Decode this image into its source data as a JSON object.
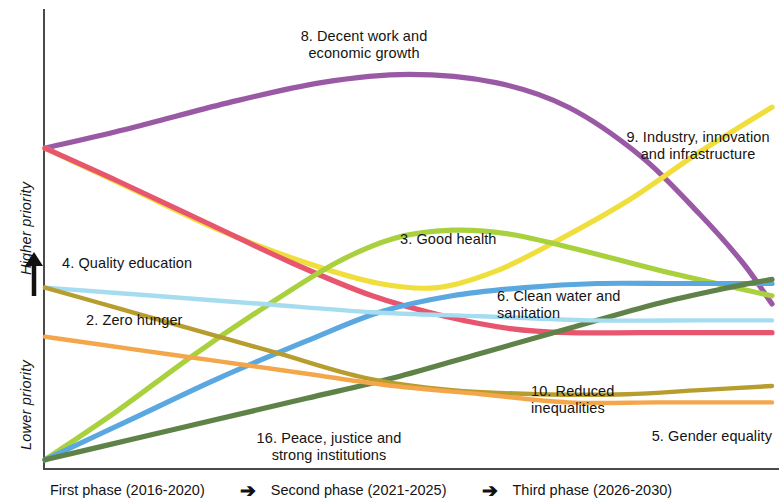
{
  "chart_data": {
    "type": "line",
    "title": "",
    "subtitle": "",
    "xlabel": "",
    "ylabel": "priority",
    "grid": false,
    "legend_position": "inline-annotations",
    "x": [
      "First phase (2016-2020)",
      "Second phase (2021-2025)",
      "Third phase (2026-2030)"
    ],
    "xlim": [
      0,
      100
    ],
    "ylim": [
      0,
      100
    ],
    "y_axis_ticks": [
      "Lower priority",
      "Higher priority"
    ],
    "y_axis_direction": "up",
    "note": "Relative priority of SDGs over three phases; y values are relative priority ranks (0 = lowest, 100 = highest).",
    "series": [
      {
        "name": "8. Decent work and economic growth",
        "color": "#9A59A5",
        "values": [
          78,
          96,
          40
        ],
        "points": [
          [
            0,
            78
          ],
          [
            12,
            83
          ],
          [
            25,
            89
          ],
          [
            38,
            94
          ],
          [
            50,
            96
          ],
          [
            62,
            94
          ],
          [
            72,
            88
          ],
          [
            82,
            76
          ],
          [
            90,
            62
          ],
          [
            96,
            50
          ],
          [
            100,
            40
          ]
        ]
      },
      {
        "name": "9. Industry, innovation and infrastructure",
        "color": "#EFDE3C",
        "values": [
          78,
          44,
          88
        ],
        "points": [
          [
            0,
            78
          ],
          [
            12,
            68
          ],
          [
            24,
            58
          ],
          [
            36,
            50
          ],
          [
            46,
            45
          ],
          [
            54,
            44
          ],
          [
            62,
            48
          ],
          [
            70,
            55
          ],
          [
            80,
            65
          ],
          [
            90,
            77
          ],
          [
            100,
            88
          ]
        ]
      },
      {
        "name": "4. Quality education",
        "color": "#E8556E",
        "values": [
          78,
          36,
          31
        ],
        "points": [
          [
            0,
            78
          ],
          [
            10,
            70
          ],
          [
            22,
            60
          ],
          [
            34,
            50
          ],
          [
            45,
            42
          ],
          [
            55,
            37
          ],
          [
            64,
            34
          ],
          [
            72,
            33
          ],
          [
            82,
            33
          ],
          [
            92,
            33
          ],
          [
            100,
            33
          ]
        ]
      },
      {
        "name": "3. Good health",
        "color": "#A9D13E",
        "values": [
          2,
          58,
          44
        ],
        "points": [
          [
            0,
            2
          ],
          [
            10,
            14
          ],
          [
            20,
            27
          ],
          [
            30,
            39
          ],
          [
            40,
            50
          ],
          [
            48,
            56
          ],
          [
            56,
            58
          ],
          [
            64,
            57
          ],
          [
            74,
            53
          ],
          [
            85,
            48
          ],
          [
            100,
            42
          ]
        ]
      },
      {
        "name": "6. Clean water and sanitation",
        "color": "#5BA8E0",
        "values": [
          2,
          44,
          44
        ],
        "points": [
          [
            0,
            2
          ],
          [
            12,
            12
          ],
          [
            24,
            22
          ],
          [
            36,
            31
          ],
          [
            46,
            38
          ],
          [
            56,
            42
          ],
          [
            66,
            44
          ],
          [
            76,
            45
          ],
          [
            86,
            45
          ],
          [
            94,
            45
          ],
          [
            100,
            45
          ]
        ]
      },
      {
        "name": "16. Peace, justice and strong institutions",
        "color": "#5E8248",
        "values": [
          2,
          22,
          46
        ],
        "points": [
          [
            0,
            2
          ],
          [
            12,
            7
          ],
          [
            24,
            12
          ],
          [
            36,
            17
          ],
          [
            48,
            22
          ],
          [
            60,
            28
          ],
          [
            72,
            34
          ],
          [
            84,
            40
          ],
          [
            94,
            44
          ],
          [
            100,
            46
          ]
        ]
      },
      {
        "name": "2. Zero hunger",
        "color": "#A6DCF0",
        "values": [
          44,
          37,
          36
        ],
        "points": [
          [
            0,
            44
          ],
          [
            15,
            42
          ],
          [
            30,
            40
          ],
          [
            45,
            38
          ],
          [
            60,
            37
          ],
          [
            75,
            36
          ],
          [
            90,
            36
          ],
          [
            100,
            36
          ]
        ]
      },
      {
        "name": "10. Reduced inequalities",
        "color": "#B79C2E",
        "values": [
          44,
          18,
          20
        ],
        "points": [
          [
            0,
            44
          ],
          [
            10,
            39
          ],
          [
            20,
            34
          ],
          [
            32,
            28
          ],
          [
            44,
            22
          ],
          [
            56,
            19
          ],
          [
            68,
            18
          ],
          [
            80,
            18
          ],
          [
            90,
            19
          ],
          [
            100,
            20
          ]
        ]
      },
      {
        "name": "5. Gender equality",
        "color": "#F4A64A",
        "values": [
          32,
          16,
          16
        ],
        "points": [
          [
            0,
            32
          ],
          [
            12,
            29
          ],
          [
            24,
            26
          ],
          [
            36,
            23
          ],
          [
            48,
            20
          ],
          [
            60,
            18
          ],
          [
            72,
            16
          ],
          [
            84,
            16
          ],
          [
            94,
            16
          ],
          [
            100,
            16
          ]
        ]
      }
    ]
  },
  "axis": {
    "y_top_label": "Higher priority",
    "y_bottom_label": "Lower priority",
    "arrow_glyph": "↑"
  },
  "labels": {
    "decent_work": "8. Decent work and\neconomic growth",
    "industry": "9. Industry, innovation\nand infrastructure",
    "good_health": "3. Good health",
    "quality_education": "4. Quality education",
    "clean_water": "6. Clean water and\nsanitation",
    "zero_hunger": "2. Zero hunger",
    "reduced_inequalities": "10. Reduced\ninequalities",
    "gender_equality": "5. Gender equality",
    "peace_justice": "16. Peace, justice and\nstrong institutions"
  },
  "phases": {
    "first": "First phase (2016-2020)",
    "second": "Second phase (2021-2025)",
    "third": "Third phase (2026-2030)",
    "arrow": "➔"
  }
}
